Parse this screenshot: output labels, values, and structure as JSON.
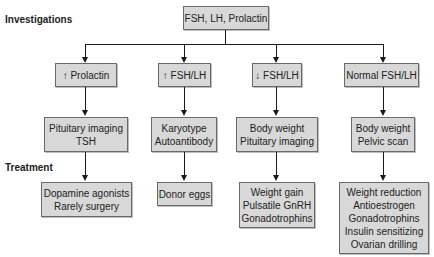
{
  "labels": {
    "investigations": "Investigations",
    "treatment": "Treatment"
  },
  "root": {
    "text": "FSH, LH, Prolactin"
  },
  "branches": [
    {
      "condition": "↑ Prolactin",
      "investigations": [
        "Pituitary imaging",
        "TSH"
      ],
      "treatment": [
        "Dopamine agonists",
        "Rarely surgery"
      ]
    },
    {
      "condition": "↑ FSH/LH",
      "investigations": [
        "Karyotype",
        "Autoantibody"
      ],
      "treatment": [
        "Donor eggs"
      ]
    },
    {
      "condition": "↓ FSH/LH",
      "investigations": [
        "Body weight",
        "Pituitary imaging"
      ],
      "treatment": [
        "Weight gain",
        "Pulsatile GnRH",
        "Gonadotrophins"
      ]
    },
    {
      "condition": "Normal FSH/LH",
      "investigations": [
        "Body weight",
        "Pelvic scan"
      ],
      "treatment": [
        "Weight reduction",
        "Antioestrogen",
        "Gonadotrophins",
        "Insulin sensitizing",
        "Ovarian drilling"
      ]
    }
  ],
  "colors": {
    "box_fill": "#d8d8d8",
    "box_border": "#6a6a6a",
    "line": "#1a1a1a"
  }
}
